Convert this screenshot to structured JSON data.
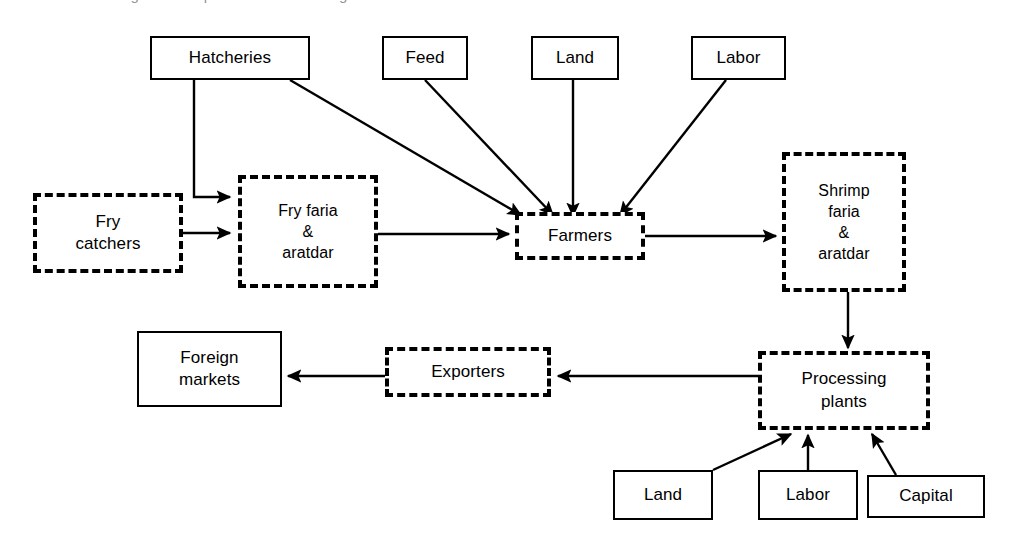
{
  "diagram": {
    "title_remnant": "Figure   Shrimp value chain in Bangladesh",
    "style": {
      "line_color": "#000000",
      "background": "#ffffff",
      "solid_border_desc": "solid",
      "dashed_border_desc": "dashed"
    },
    "nodes": [
      {
        "id": "hatcheries",
        "label": "Hatcheries",
        "border": "solid",
        "x": 150,
        "y": 36,
        "w": 160,
        "h": 44,
        "font": 17
      },
      {
        "id": "feed",
        "label": "Feed",
        "border": "solid",
        "x": 382,
        "y": 36,
        "w": 86,
        "h": 44,
        "font": 17
      },
      {
        "id": "land-top",
        "label": "Land",
        "border": "solid",
        "x": 531,
        "y": 36,
        "w": 88,
        "h": 44,
        "font": 17
      },
      {
        "id": "labor-top",
        "label": "Labor",
        "border": "solid",
        "x": 691,
        "y": 36,
        "w": 95,
        "h": 44,
        "font": 17
      },
      {
        "id": "fry-catchers",
        "label": "Fry\ncatchers",
        "border": "dashed",
        "x": 33,
        "y": 193,
        "w": 150,
        "h": 80,
        "font": 17
      },
      {
        "id": "fry-faria",
        "label": "Fry faria\n&\naratdar",
        "border": "dashed",
        "x": 238,
        "y": 175,
        "w": 140,
        "h": 113,
        "font": 16
      },
      {
        "id": "farmers",
        "label": "Farmers",
        "border": "dashed",
        "x": 515,
        "y": 212,
        "w": 130,
        "h": 48,
        "font": 17
      },
      {
        "id": "shrimp-faria",
        "label": "Shrimp\nfaria\n&\naratdar",
        "border": "dashed",
        "x": 782,
        "y": 152,
        "w": 124,
        "h": 140,
        "font": 16
      },
      {
        "id": "foreign-markets",
        "label": "Foreign\nmarkets",
        "border": "solid",
        "x": 137,
        "y": 331,
        "w": 145,
        "h": 76,
        "font": 17
      },
      {
        "id": "exporters",
        "label": "Exporters",
        "border": "dashed",
        "x": 385,
        "y": 347,
        "w": 166,
        "h": 50,
        "font": 17
      },
      {
        "id": "processing-plants",
        "label": "Processing\nplants",
        "border": "dashed",
        "x": 758,
        "y": 351,
        "w": 172,
        "h": 79,
        "font": 17
      },
      {
        "id": "land-bottom",
        "label": "Land",
        "border": "solid",
        "x": 613,
        "y": 470,
        "w": 100,
        "h": 50,
        "font": 17
      },
      {
        "id": "labor-bottom",
        "label": "Labor",
        "border": "solid",
        "x": 758,
        "y": 470,
        "w": 100,
        "h": 50,
        "font": 17
      },
      {
        "id": "capital",
        "label": "Capital",
        "border": "solid",
        "x": 867,
        "y": 475,
        "w": 118,
        "h": 43,
        "font": 17
      }
    ],
    "edges": [
      {
        "id": "hatcheries-to-fry-faria",
        "from": "hatcheries",
        "to": "fry-faria",
        "points": "194,80 194,197 230,197"
      },
      {
        "id": "hatcheries-to-farmers",
        "from": "hatcheries",
        "to": "farmers",
        "points": "290,80 521,215"
      },
      {
        "id": "fry-catchers-to-fry-faria",
        "from": "fry-catchers",
        "to": "fry-faria",
        "points": "183,233 230,233"
      },
      {
        "id": "feed-to-farmers",
        "from": "feed",
        "to": "farmers",
        "points": "425,80 553,215"
      },
      {
        "id": "land-top-to-farmers",
        "from": "land-top",
        "to": "farmers",
        "points": "573,80 573,216"
      },
      {
        "id": "labor-top-to-farmers",
        "from": "labor-top",
        "to": "farmers",
        "points": "726,80 620,215"
      },
      {
        "id": "fry-faria-to-farmers",
        "from": "fry-faria",
        "to": "farmers",
        "points": "378,234 509,234"
      },
      {
        "id": "farmers-to-shrimp-faria",
        "from": "farmers",
        "to": "shrimp-faria",
        "points": "645,236 776,236"
      },
      {
        "id": "shrimp-faria-to-processing",
        "from": "shrimp-faria",
        "to": "processing-plants",
        "points": "848,292 848,348"
      },
      {
        "id": "processing-to-exporters",
        "from": "processing-plants",
        "to": "exporters",
        "points": "758,376 558,376"
      },
      {
        "id": "exporters-to-foreign",
        "from": "exporters",
        "to": "foreign-markets",
        "points": "385,376 288,376"
      },
      {
        "id": "land-bottom-to-processing",
        "from": "land-bottom",
        "to": "processing-plants",
        "points": "713,470 791,434"
      },
      {
        "id": "labor-bottom-to-processing",
        "from": "labor-bottom",
        "to": "processing-plants",
        "points": "808,470 808,435"
      },
      {
        "id": "capital-to-processing",
        "from": "capital",
        "to": "processing-plants",
        "points": "896,475 872,434"
      }
    ]
  }
}
